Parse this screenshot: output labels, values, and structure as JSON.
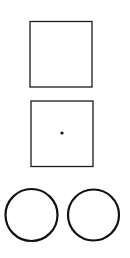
{
  "figure": {
    "background": "#ffffff",
    "stroke_color": "#1a1a1a",
    "shapes": [
      {
        "type": "square",
        "label": "empty-square",
        "x": 30,
        "y": 21,
        "w": 62,
        "h": 66
      },
      {
        "type": "square",
        "label": "square-with-dot",
        "x": 31,
        "y": 101,
        "w": 62,
        "h": 66,
        "dot": {
          "cx": 62,
          "cy": 133,
          "r": 1.6
        }
      },
      {
        "type": "circle",
        "label": "left-circle",
        "cx": 32,
        "cy": 215,
        "r": 26
      },
      {
        "type": "circle",
        "label": "right-circle",
        "cx": 94,
        "cy": 215,
        "r": 26
      }
    ]
  }
}
